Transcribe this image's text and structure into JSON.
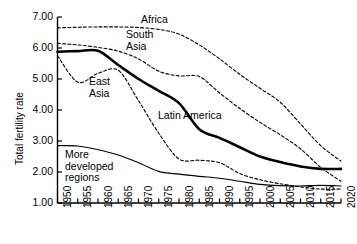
{
  "chart_data": {
    "type": "line",
    "title": "",
    "xlabel": "",
    "ylabel": "Total fertility rate",
    "xlim": [
      1950,
      2020
    ],
    "ylim": [
      1.0,
      7.0
    ],
    "yticks": [
      "1.00",
      "2.00",
      "3.00",
      "4.00",
      "5.00",
      "6.00",
      "7.00"
    ],
    "ytick_values": [
      1.0,
      2.0,
      3.0,
      4.0,
      5.0,
      6.0,
      7.0
    ],
    "grid": false,
    "legend_position": "inline-annotations",
    "x": [
      1950,
      1955,
      1960,
      1965,
      1970,
      1975,
      1980,
      1985,
      1990,
      1995,
      2000,
      2005,
      2010,
      2015,
      2020
    ],
    "xtick_labels": [
      "1950",
      "1955",
      "1960",
      "1965",
      "1970",
      "1975",
      "1980",
      "1985",
      "1990",
      "1995",
      "2000",
      "2005",
      "2010",
      "2015",
      "2020"
    ],
    "series": [
      {
        "name": "Africa",
        "style": "dashed",
        "width": 1.1,
        "color": "#000000",
        "values": [
          6.65,
          6.67,
          6.68,
          6.68,
          6.66,
          6.6,
          6.45,
          6.1,
          5.65,
          5.15,
          4.7,
          4.25,
          3.55,
          2.85,
          2.35
        ]
      },
      {
        "name": "South Asia",
        "style": "dashed",
        "width": 1.1,
        "color": "#000000",
        "values": [
          6.15,
          6.1,
          6.02,
          5.9,
          5.65,
          5.25,
          5.1,
          5.08,
          4.55,
          4.05,
          3.6,
          3.2,
          2.75,
          2.15,
          1.7
        ]
      },
      {
        "name": "Latin America",
        "style": "solid",
        "width": 2.6,
        "color": "#000000",
        "values": [
          5.88,
          5.9,
          5.91,
          5.45,
          5.0,
          4.62,
          4.22,
          3.38,
          3.1,
          2.8,
          2.5,
          2.32,
          2.18,
          2.1,
          2.1
        ]
      },
      {
        "name": "East Asia",
        "style": "dashed",
        "width": 1.1,
        "color": "#000000",
        "values": [
          5.75,
          4.9,
          5.18,
          5.28,
          4.3,
          3.25,
          2.42,
          2.38,
          2.3,
          1.95,
          1.75,
          1.62,
          1.52,
          1.45,
          1.45
        ]
      },
      {
        "name": "More developed regions",
        "style": "solid",
        "width": 1.1,
        "color": "#000000",
        "values": [
          2.85,
          2.84,
          2.72,
          2.55,
          2.3,
          2.02,
          1.93,
          1.86,
          1.8,
          1.7,
          1.6,
          1.56,
          1.55,
          1.57,
          1.55
        ]
      }
    ],
    "annotations": [
      {
        "text": "Africa",
        "for": "Africa"
      },
      {
        "text": "South",
        "for": "South Asia"
      },
      {
        "text": "Asia",
        "for": "South Asia"
      },
      {
        "text": "East",
        "for": "East Asia"
      },
      {
        "text": "Asia",
        "for": "East Asia"
      },
      {
        "text": "Latin America",
        "for": "Latin America"
      },
      {
        "text": "More",
        "for": "More developed regions"
      },
      {
        "text": "developed",
        "for": "More developed regions"
      },
      {
        "text": "regions",
        "for": "More developed regions"
      }
    ]
  }
}
